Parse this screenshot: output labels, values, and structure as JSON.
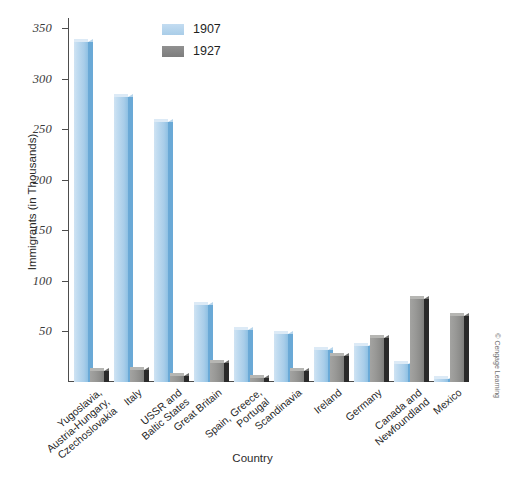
{
  "chart_data": {
    "type": "bar",
    "title": "",
    "xlabel": "Country",
    "ylabel": "Immigrants (in Thousands)",
    "ylim": [
      0,
      360
    ],
    "yticks": [
      50,
      100,
      150,
      200,
      250,
      300,
      350
    ],
    "grid": false,
    "legend_position": "top-center",
    "categories": [
      "Yugoslavia,\nAustria-Hungary,\nCzechoslovakia",
      "Italy",
      "USSR and\nBaltic States",
      "Great Britain",
      "Spain, Greece,\nPortugal",
      "Scandinavia",
      "Ireland",
      "Germany",
      "Canada and\nNewfoundland",
      "Mexico"
    ],
    "series": [
      {
        "name": "1907",
        "color": "#a8cde9",
        "values": [
          336,
          282,
          257,
          76,
          51,
          47,
          32,
          36,
          18,
          3
        ]
      },
      {
        "name": "1927",
        "color": "#8c8c8a",
        "values": [
          11,
          12,
          6,
          19,
          4,
          11,
          26,
          44,
          82,
          65
        ]
      }
    ],
    "annotations": [
      "© Cengage Learning"
    ]
  },
  "axes": {
    "y_title": "Immigrants (in Thousands)",
    "x_title": "Country",
    "y_tick_labels": [
      "350",
      "300",
      "250",
      "200",
      "150",
      "100",
      "50"
    ]
  },
  "legend": {
    "items": [
      {
        "label": "1907",
        "swatch": "light-blue-swatch"
      },
      {
        "label": "1927",
        "swatch": "gray-swatch"
      }
    ]
  },
  "credit": "© Cengage Learning"
}
